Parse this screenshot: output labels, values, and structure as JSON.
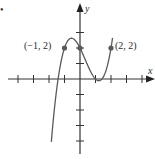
{
  "figure": {
    "bullet": "•",
    "x_axis_label": "x",
    "y_axis_label": "y",
    "points": [
      {
        "label": "(−1, 2)",
        "x": -1,
        "y": 2,
        "marked": true
      },
      {
        "label": "",
        "x": 0,
        "y": 2,
        "marked": true
      },
      {
        "label": "(2, 2)",
        "x": 2,
        "y": 2,
        "marked": true
      }
    ],
    "colors": {
      "curve": "#5a5a5a",
      "axis": "#333333",
      "point": "#5a5a5a"
    }
  },
  "chart_data": {
    "type": "line",
    "title": "",
    "xlabel": "x",
    "ylabel": "y",
    "xlim": [
      -4,
      4
    ],
    "ylim": [
      -4,
      4
    ],
    "grid": false,
    "x_ticks": [
      -4,
      -3,
      -2,
      -1,
      1,
      2,
      3,
      4
    ],
    "y_ticks": [
      -4,
      -3,
      -2,
      -1,
      1,
      2,
      3
    ],
    "series": [
      {
        "name": "f(x)",
        "x": [
          -1.85,
          -1.5,
          -1,
          -0.55,
          0,
          0.5,
          1,
          1.39,
          1.8,
          2.1
        ],
        "y": [
          -3.9,
          -0.63,
          2,
          2.63,
          2,
          0.88,
          0,
          -0.11,
          0.63,
          2.65
        ]
      }
    ],
    "annotations": [
      {
        "text": "(−1, 2)",
        "x": -1,
        "y": 2
      },
      {
        "text": "(2, 2)",
        "x": 2,
        "y": 2
      }
    ]
  }
}
